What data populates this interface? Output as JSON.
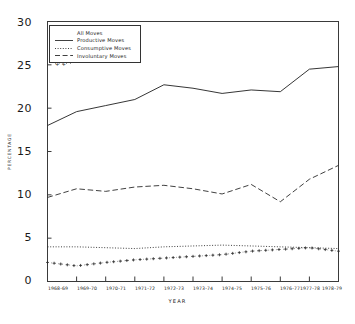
{
  "chart_data": {
    "type": "line",
    "title": "",
    "xlabel": "YEAR",
    "ylabel": "PERCENTAGE",
    "grid": false,
    "legend_position": "upper-left",
    "ylim": [
      0,
      30
    ],
    "yticks": [
      0,
      5,
      10,
      15,
      20,
      25,
      30
    ],
    "ytick_labels": [
      "0",
      "5",
      "10",
      "15",
      "20",
      "25",
      "30"
    ],
    "categories": [
      "1968-69",
      "1969-70",
      "1970-71",
      "1971-72",
      "1972-73",
      "1973-74",
      "1974-75",
      "1975-76",
      "1976-77",
      "1977-78",
      "1978-79"
    ],
    "series": [
      {
        "name": "All Moves",
        "style": "solid",
        "marker": "none",
        "color": "#2b2b2b",
        "values": [
          18.0,
          19.6,
          20.3,
          21.0,
          22.7,
          22.3,
          21.7,
          22.1,
          21.9,
          24.5,
          24.8
        ]
      },
      {
        "name": "Productive Moves",
        "style": "dotted",
        "marker": "none",
        "color": "#2b2b2b",
        "values": [
          4.0,
          4.0,
          3.9,
          3.8,
          4.0,
          4.1,
          4.2,
          4.1,
          4.0,
          3.9,
          3.8
        ]
      },
      {
        "name": "Consumptive Moves",
        "style": "dashed",
        "marker": "none",
        "color": "#2b2b2b",
        "values": [
          9.7,
          10.7,
          10.4,
          10.9,
          11.1,
          10.7,
          10.1,
          11.2,
          9.2,
          11.8,
          13.4
        ]
      },
      {
        "name": "Involuntary Moves",
        "style": "dashdot",
        "marker": "plus",
        "color": "#2b2b2b",
        "values": [
          2.2,
          1.8,
          2.2,
          2.5,
          2.7,
          2.9,
          3.1,
          3.5,
          3.7,
          3.9,
          3.5
        ]
      }
    ]
  },
  "legend": {
    "entries": [
      {
        "label": "All Moves"
      },
      {
        "label": "Productive Moves"
      },
      {
        "label": "Consumptive Moves"
      },
      {
        "label": "Involuntary Moves"
      }
    ]
  },
  "axes": {
    "y_title": "PERCENTAGE",
    "x_title": "YEAR"
  }
}
